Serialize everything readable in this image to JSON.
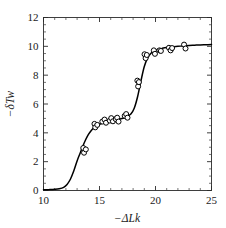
{
  "chart_data": {
    "type": "scatter",
    "title": "",
    "xlabel": "−ΔLk",
    "ylabel": "−δTw",
    "xlim": [
      10,
      25
    ],
    "ylim": [
      0,
      12
    ],
    "xticks": [
      10,
      15,
      20,
      25
    ],
    "xtick_labels": [
      "10",
      "15",
      "20",
      "25"
    ],
    "yticks": [
      0,
      2,
      4,
      6,
      8,
      10,
      12
    ],
    "ytick_labels": [
      "0",
      "2",
      "4",
      "6",
      "8",
      "10",
      "12"
    ],
    "x_minor_interval": 1,
    "y_minor_interval": 0.5,
    "grid": false,
    "legend": null,
    "series": [
      {
        "name": "model curve",
        "type": "line",
        "color": "#000000",
        "x": [
          10.0,
          10.5,
          11.0,
          11.4,
          11.8,
          12.1,
          12.4,
          12.7,
          13.0,
          13.25,
          13.5,
          13.75,
          14.0,
          14.25,
          14.5,
          14.75,
          15.0,
          15.5,
          16.0,
          16.5,
          17.0,
          17.4,
          17.8,
          18.1,
          18.4,
          18.7,
          19.0,
          19.3,
          19.6,
          19.9,
          20.2,
          20.6,
          21.0,
          21.5,
          22.0,
          22.5,
          23.0,
          23.5,
          24.0,
          24.5,
          25.0
        ],
        "y": [
          0.05,
          0.06,
          0.08,
          0.12,
          0.22,
          0.42,
          0.78,
          1.35,
          2.05,
          2.55,
          3.05,
          3.5,
          3.88,
          4.15,
          4.36,
          4.5,
          4.6,
          4.73,
          4.82,
          4.9,
          4.99,
          5.1,
          5.3,
          5.7,
          6.5,
          7.6,
          8.6,
          9.2,
          9.52,
          9.68,
          9.78,
          9.86,
          9.92,
          9.97,
          10.0,
          10.03,
          10.06,
          10.08,
          10.1,
          10.11,
          10.12
        ]
      },
      {
        "name": "experimental points",
        "type": "scatter",
        "marker": "open-circle",
        "color": "#000000",
        "points": [
          [
            13.55,
            2.95
          ],
          [
            13.62,
            2.62
          ],
          [
            13.78,
            2.85
          ],
          [
            14.55,
            4.62
          ],
          [
            14.62,
            4.38
          ],
          [
            14.8,
            4.55
          ],
          [
            15.25,
            4.78
          ],
          [
            15.45,
            4.92
          ],
          [
            15.58,
            4.7
          ],
          [
            15.92,
            4.85
          ],
          [
            16.05,
            5.02
          ],
          [
            16.2,
            4.8
          ],
          [
            16.45,
            4.95
          ],
          [
            16.58,
            5.05
          ],
          [
            16.7,
            4.78
          ],
          [
            17.25,
            5.18
          ],
          [
            17.38,
            5.3
          ],
          [
            17.5,
            5.05
          ],
          [
            18.38,
            7.62
          ],
          [
            18.45,
            7.22
          ],
          [
            18.52,
            7.52
          ],
          [
            19.02,
            9.45
          ],
          [
            19.12,
            9.18
          ],
          [
            19.22,
            9.4
          ],
          [
            19.85,
            9.72
          ],
          [
            19.95,
            9.48
          ],
          [
            20.35,
            9.72
          ],
          [
            20.48,
            9.68
          ],
          [
            21.2,
            9.9
          ],
          [
            21.35,
            9.72
          ],
          [
            21.48,
            9.88
          ],
          [
            22.55,
            10.12
          ],
          [
            22.68,
            9.85
          ]
        ]
      }
    ]
  },
  "axes": {
    "x_axis_name": "x-axis",
    "y_axis_name": "y-axis"
  }
}
